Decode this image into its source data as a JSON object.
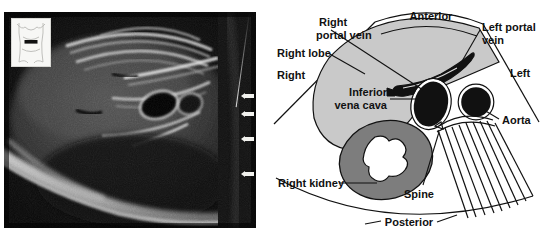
{
  "figure": {
    "type": "medical-ultrasound-with-diagram",
    "panels": [
      "ultrasound-scan",
      "labeled-line-diagram"
    ]
  },
  "ultrasound": {
    "modality": "b-mode-abdominal-ultrasound",
    "background_color": "#0a0a0a",
    "body_marker": {
      "icon": "torso-body-marker-icon",
      "transducer_indicator": "transverse-bar"
    },
    "depth_ticks": {
      "icon": "depth-caliper-arrow-icon",
      "count": 4,
      "positions_px": [
        82,
        100,
        125,
        160
      ]
    }
  },
  "diagram": {
    "orientation_labels": {
      "anterior": "Anterior",
      "posterior": "Posterior",
      "right": "Right",
      "left": "Left"
    },
    "structures": [
      {
        "id": "right-portal-vein",
        "label": "Right\nportal vein",
        "line1": "Right",
        "line2": "portal vein",
        "color": "#111111"
      },
      {
        "id": "right-lobe",
        "label": "Right lobe",
        "line1": "Right lobe",
        "line2": "",
        "color": "#c9c9c9"
      },
      {
        "id": "left-portal-vein",
        "label": "Left portal\nvein",
        "line1": "Left portal",
        "line2": "vein",
        "color": "#111111"
      },
      {
        "id": "inferior-vena-cava",
        "label": "Inferior\nvena cava",
        "line1": "Inferior",
        "line2": "vena cava",
        "color": "#111111"
      },
      {
        "id": "aorta",
        "label": "Aorta",
        "line1": "Aorta",
        "line2": "",
        "color": "#111111"
      },
      {
        "id": "right-kidney",
        "label": "Right kidney",
        "line1": "Right kidney",
        "line2": "",
        "color": "#7d7d7d"
      },
      {
        "id": "spine",
        "label": "Spine",
        "line1": "Spine",
        "line2": "",
        "color": "#ffffff"
      }
    ],
    "colors": {
      "liver_fill": "#c9c9c9",
      "kidney_fill": "#7d7d7d",
      "collecting_system_fill": "#ffffff",
      "vessel_fill": "#111111",
      "outline": "#111111",
      "background": "#ffffff"
    }
  }
}
